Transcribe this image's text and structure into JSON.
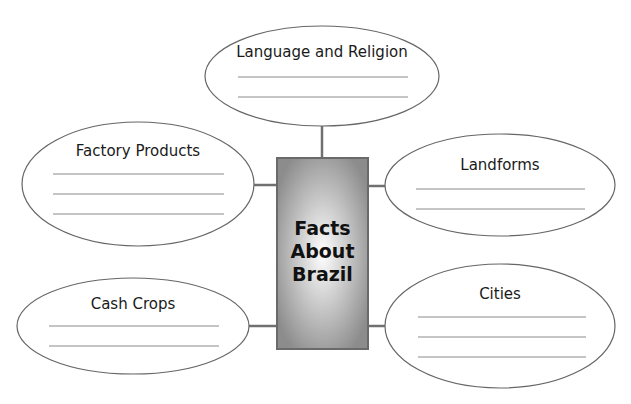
{
  "diagram": {
    "center": {
      "lines": [
        "Facts",
        "About",
        "Brazil"
      ]
    },
    "bubbles": [
      {
        "id": "language-religion",
        "title": "Language and Religion",
        "blank_lines": 2
      },
      {
        "id": "factory-products",
        "title": "Factory Products",
        "blank_lines": 3
      },
      {
        "id": "landforms",
        "title": "Landforms",
        "blank_lines": 2
      },
      {
        "id": "cash-crops",
        "title": "Cash Crops",
        "blank_lines": 2
      },
      {
        "id": "cities",
        "title": "Cities",
        "blank_lines": 3
      }
    ],
    "colors": {
      "stroke": "#666666",
      "blank_line": "#8a8a8a",
      "connector": "#707070",
      "box_edge": "#7d7d7d",
      "box_center": "#ffffff"
    }
  }
}
